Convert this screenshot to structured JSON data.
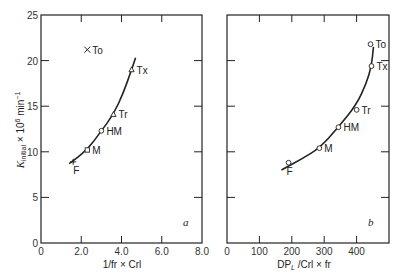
{
  "chart_data": [
    {
      "type": "scatter",
      "panel": "a",
      "xlabel": "1/fr × Crl",
      "ylabel": "K_initial × 10^6 min^-1",
      "xlim": [
        0,
        8.0
      ],
      "ylim": [
        0,
        25
      ],
      "xticks": [
        "0",
        "2.0",
        "4.0",
        "6.0",
        "8.0"
      ],
      "yticks": [
        "0",
        "5",
        "10",
        "15",
        "20",
        "25"
      ],
      "points": [
        {
          "label": "F",
          "x": 1.6,
          "y": 8.9,
          "marker": "plus"
        },
        {
          "label": "M",
          "x": 2.3,
          "y": 10.2,
          "marker": "square"
        },
        {
          "label": "HM",
          "x": 3.0,
          "y": 12.3,
          "marker": "circle"
        },
        {
          "label": "Tr",
          "x": 3.6,
          "y": 14.1,
          "marker": "triangle"
        },
        {
          "label": "Tx",
          "x": 4.5,
          "y": 19.0,
          "marker": "triangle"
        },
        {
          "label": "To",
          "x": 2.3,
          "y": 21.2,
          "marker": "x"
        }
      ],
      "fit_curve": [
        [
          1.4,
          8.7
        ],
        [
          2.3,
          10.2
        ],
        [
          3.0,
          12.3
        ],
        [
          3.6,
          14.1
        ],
        [
          4.1,
          16.5
        ],
        [
          4.5,
          19.0
        ],
        [
          4.7,
          20.3
        ]
      ],
      "panel_letter": "a"
    },
    {
      "type": "scatter",
      "panel": "b",
      "xlabel": "DP_L /Crl × fr",
      "ylabel": "K_initial × 10^6 min^-1",
      "xlim": [
        0,
        500
      ],
      "ylim": [
        0,
        25
      ],
      "xticks": [
        "0",
        "100",
        "200",
        "300",
        "400"
      ],
      "yticks": [
        "0",
        "5",
        "10",
        "15",
        "20",
        "25"
      ],
      "points": [
        {
          "label": "F",
          "x": 190,
          "y": 8.8,
          "marker": "circle"
        },
        {
          "label": "M",
          "x": 285,
          "y": 10.4,
          "marker": "circle"
        },
        {
          "label": "HM",
          "x": 344,
          "y": 12.7,
          "marker": "circle"
        },
        {
          "label": "Tr",
          "x": 400,
          "y": 14.6,
          "marker": "circle"
        },
        {
          "label": "Tx",
          "x": 446,
          "y": 19.4,
          "marker": "circle"
        },
        {
          "label": "To",
          "x": 443,
          "y": 21.8,
          "marker": "circle"
        }
      ],
      "fit_curve": [
        [
          168,
          8.0
        ],
        [
          230,
          9.2
        ],
        [
          285,
          10.4
        ],
        [
          344,
          12.7
        ],
        [
          400,
          15.2
        ],
        [
          430,
          17.5
        ],
        [
          446,
          19.4
        ],
        [
          452,
          21.5
        ]
      ],
      "panel_letter": "b"
    }
  ],
  "axes": {
    "ylabel_main": "K",
    "ylabel_sub": "initial",
    "ylabel_rest": " × 10",
    "ylabel_exp": "6",
    "ylabel_unit": " min",
    "ylabel_unit_exp": "−1",
    "a_xlabel": "1/fr × Crl",
    "b_xlabel_main": "DP",
    "b_xlabel_sub": "L",
    "b_xlabel_rest": " /Crl × fr",
    "a_letter": "a",
    "b_letter": "b"
  },
  "colors": {
    "ink": "#222222",
    "background": "#ffffff"
  }
}
